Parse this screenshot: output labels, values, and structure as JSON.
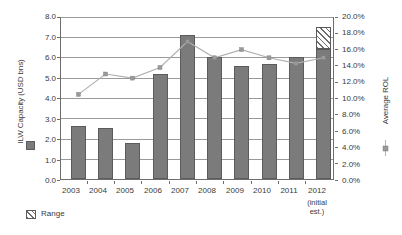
{
  "chart_data": {
    "type": "bar",
    "title": "",
    "categories": [
      "2003",
      "2004",
      "2005",
      "2006",
      "2007",
      "2008",
      "2009",
      "2010",
      "2011",
      "2012"
    ],
    "category_sublabels": [
      "",
      "",
      "",
      "",
      "",
      "",
      "",
      "",
      "",
      "(initial est.)"
    ],
    "xlabel": "",
    "ylabel": "ILW Capacity (USD bns)",
    "ylabel_secondary": "Average ROL",
    "ylim": [
      0,
      8
    ],
    "ylim_secondary": [
      0,
      0.2
    ],
    "yticks": [
      "0.0",
      "1.0",
      "2.0",
      "3.0",
      "4.0",
      "5.0",
      "6.0",
      "7.0",
      "8.0"
    ],
    "yticks_secondary": [
      "0.0%",
      "2.0%",
      "4.0%",
      "6.0%",
      "8.0%",
      "10.0%",
      "12.0%",
      "14.0%",
      "16.0%",
      "18.0%",
      "20.0%"
    ],
    "grid": true,
    "legend_position": "left-axis-and-below",
    "series": [
      {
        "name": "ILW Capacity (USD bns)",
        "type": "bar",
        "axis": "left",
        "color": "#7b7b7b",
        "values": [
          2.6,
          2.5,
          1.8,
          5.2,
          7.1,
          6.0,
          5.6,
          5.7,
          6.0,
          6.4
        ]
      },
      {
        "name": "Range",
        "type": "bar-range",
        "axis": "left",
        "color": "#ffffff",
        "values": [
          null,
          null,
          null,
          null,
          null,
          null,
          null,
          null,
          null,
          7.45
        ]
      },
      {
        "name": "Average ROL",
        "type": "line",
        "axis": "right",
        "color": "#a6a6a6",
        "values": [
          0.105,
          0.13,
          0.125,
          0.138,
          0.17,
          0.15,
          0.16,
          0.15,
          0.143,
          0.15
        ]
      }
    ]
  },
  "legend": {
    "capacity_label": "ILW Capacity (USD bns)",
    "range_label": "Range",
    "rol_label": "Average ROL"
  },
  "icons": {
    "capacity_swatch": "filled-square-icon",
    "range_swatch": "hatched-square-icon",
    "rol_marker": "line-marker-icon"
  }
}
